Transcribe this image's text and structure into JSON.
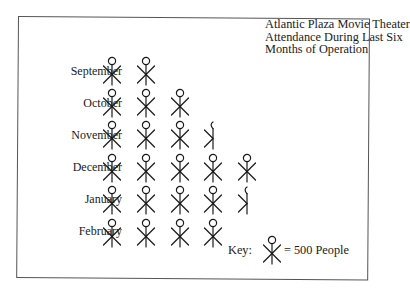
{
  "chart_data": {
    "type": "pictograph",
    "title": "Atlantic Plaza Movie Theater Attendance During Last Six Months of Operation",
    "title_lines": [
      "Atlantic Plaza Movie Theater",
      "Attendance During Last Six",
      "Months of Operation"
    ],
    "categories": [
      "September",
      "October",
      "November",
      "December",
      "January",
      "February"
    ],
    "symbols": [
      2,
      3,
      3.5,
      5,
      4.5,
      4
    ],
    "values": [
      1000,
      1500,
      1750,
      2500,
      2250,
      2000
    ],
    "unit_per_symbol": 500,
    "unit_label": "People",
    "key": {
      "label": "Key:",
      "value_text": "= 500 People"
    },
    "xlabel": "",
    "ylabel": "",
    "grid": false,
    "legend_position": "bottom-right"
  }
}
